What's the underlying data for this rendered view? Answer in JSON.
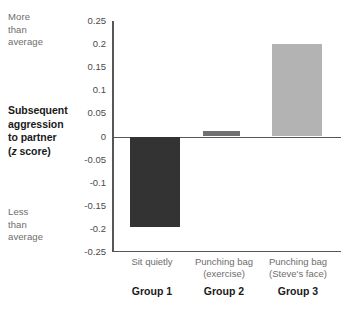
{
  "annotations": {
    "top_note": "More\nthan\naverage",
    "top_note_lines": [
      "More",
      "than",
      "average"
    ],
    "bottom_note_lines": [
      "Less",
      "than",
      "average"
    ]
  },
  "axis_title": {
    "line1": "Subsequent",
    "line2": "aggression",
    "line3": "to partner",
    "line4_pre": "(",
    "line4_ital": "z",
    "line4_post": " score)"
  },
  "colors": {
    "bar_group1": "#333333",
    "bar_group2": "#6f7072",
    "bar_group3": "#b3b3b3",
    "axis": "#55565a",
    "tick_text": "#4a4a4a",
    "muted_text": "#6d6d6d",
    "bold_text": "#1a1a1a",
    "background": "#ffffff"
  },
  "chart_data": {
    "type": "bar",
    "title": "",
    "xlabel": "",
    "ylabel": "Subsequent aggression to partner (z score)",
    "ylim": [
      -0.25,
      0.25
    ],
    "yticks": [
      0.25,
      0.2,
      0.15,
      0.1,
      0.05,
      0,
      -0.05,
      -0.1,
      -0.15,
      -0.2,
      -0.25
    ],
    "ytick_labels": [
      "0.25",
      "0.2",
      "0.15",
      "0.1",
      "0.05",
      "0",
      "-0.05",
      "-0.1",
      "-0.15",
      "-0.2",
      "-0.25"
    ],
    "grid": false,
    "legend": "none",
    "zero_reference_line": true,
    "categories": [
      "Sit quietly",
      "Punching bag (exercise)",
      "Punching bag (Steve's face)"
    ],
    "category_labels": [
      {
        "line1": "Sit quietly",
        "line2": "",
        "group": "Group 1"
      },
      {
        "line1": "Punching bag",
        "line2": "(exercise)",
        "group": "Group 2"
      },
      {
        "line1": "Punching bag",
        "line2": "(Steve's face)",
        "group": "Group 3"
      }
    ],
    "values": [
      -0.195,
      0.012,
      0.2
    ],
    "bar_colors": [
      "#333333",
      "#6f7072",
      "#b3b3b3"
    ],
    "annotations_axis": {
      "high_end": "More than average",
      "low_end": "Less than average"
    }
  }
}
